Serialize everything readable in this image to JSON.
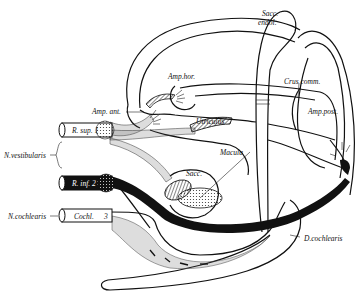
{
  "figure": {
    "labels": {
      "sacc_endol": [
        "Sacc.",
        "endol."
      ],
      "amp_hor": "Amp.hor.",
      "crus_comm": "Crus comm.",
      "amp_ant": "Amp. ant.",
      "amp_post": "Amp.post.",
      "utriculus": "Utriculus",
      "macula": "Macula",
      "sacc": "Sacc.",
      "r_sup": "R. sup. 1",
      "r_inf": "R. inf. 2",
      "n_vestibularis": "N.vestibularis",
      "n_cochlearis": "N.cochlearis",
      "cochl": "Cochl.",
      "cochl_num": "3",
      "d_cochlearis": "D.cochlearis"
    },
    "colors": {
      "ink": "#111111",
      "background": "#ffffff"
    }
  }
}
